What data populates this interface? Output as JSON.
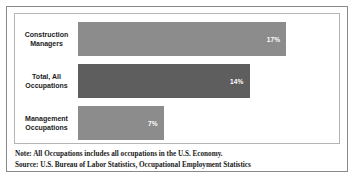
{
  "chart_data": {
    "type": "bar",
    "orientation": "horizontal",
    "title": "",
    "xlabel": "",
    "ylabel": "",
    "categories": [
      "Construction Managers",
      "Total, All Occupations",
      "Management Occupations"
    ],
    "values": [
      17,
      14,
      7
    ],
    "value_labels": [
      "17%",
      "14%",
      "7%"
    ],
    "unit": "%",
    "xlim": [
      0,
      20
    ],
    "grid": false,
    "legend": null,
    "series": [
      {
        "name": "Percent",
        "values": [
          17,
          14,
          7
        ]
      }
    ],
    "bars": [
      {
        "category_line1": "Construction",
        "category_line2": "Managers",
        "value": 17,
        "label": "17%",
        "color": "#8c8c8c"
      },
      {
        "category_line1": "Total, All",
        "category_line2": "Occupations",
        "value": 14,
        "label": "14%",
        "color": "#5e5e5e"
      },
      {
        "category_line1": "Management",
        "category_line2": "Occupations",
        "value": 7,
        "label": "7%",
        "color": "#8c8c8c"
      }
    ],
    "annotations": [
      "Note: All Occupations includes all occupations in the U.S. Economy.",
      "Source: U.S. Bureau of Labor Statistics, Occupational Employment Statistics"
    ]
  },
  "footnotes": {
    "note": "Note: All Occupations includes all occupations in the U.S. Economy.",
    "source": "Source: U.S. Bureau of Labor Statistics, Occupational Employment Statistics"
  },
  "colors": {
    "bar_light": "#8c8c8c",
    "bar_dark": "#5e5e5e",
    "outer_border": "#8a8a8a",
    "plot_border": "#b4b4b4",
    "background": "#ffffff",
    "label_text": "#1c1c1c",
    "value_text": "#ffffff"
  }
}
